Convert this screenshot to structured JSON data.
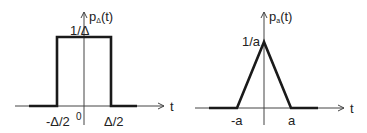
{
  "left_plot": {
    "title_func": "p",
    "title_sub": "Δ",
    "title_arg": "(t)",
    "height_label": "1/Δ",
    "x_axis_label": "t",
    "tick_neg": "-Δ/2",
    "tick_zero": "0",
    "tick_pos": "Δ/2",
    "shape": "rectangle"
  },
  "right_plot": {
    "title_func": "p",
    "title_sub": "a",
    "title_arg": "(t)",
    "height_label": "1/a",
    "x_axis_label": "t",
    "tick_neg": "-a",
    "tick_pos": "a",
    "shape": "triangle"
  },
  "colors": {
    "line": "#222222",
    "axis": "#333333"
  }
}
